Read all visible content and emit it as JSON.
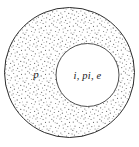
{
  "diagram": {
    "canvas": {
      "width": 139,
      "height": 147,
      "background": "#ffffff"
    },
    "outer_region": {
      "label": "p",
      "shape": "circle",
      "center_x": 69.5,
      "center_y": 72.5,
      "radius": 65.5,
      "fill": "stipple",
      "fill_color": "#8a8a8a",
      "stroke_color": "#2b2b2b",
      "stroke_width": 1,
      "label_x": 36,
      "label_y": 78
    },
    "inner_region": {
      "label": "i, pi, e",
      "shape": "circle",
      "center_x": 87.5,
      "center_y": 75,
      "radius": 31.5,
      "fill_color": "#ffffff",
      "stroke_color": "#3a3a3a",
      "stroke_width": 1,
      "label_x": 87.5,
      "label_y": 78.5
    }
  }
}
